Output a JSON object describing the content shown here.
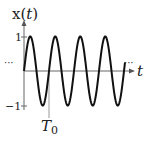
{
  "chart_data": {
    "type": "line",
    "title": "",
    "ylabel": "x(t)",
    "xlabel": "t",
    "y_ticks": [
      "1",
      "−1"
    ],
    "x_annotations": [
      "T0"
    ],
    "ellipsis_left": "···",
    "ellipsis_right": "···",
    "function": "sin(2πt/T0)",
    "periods_shown": 4.2,
    "ylim": [
      -1,
      1
    ]
  },
  "labels": {
    "ylabel_main": "x(",
    "ylabel_t": "t",
    "ylabel_close": ")",
    "xlabel": "t",
    "tick_pos": "1",
    "tick_neg": "−1",
    "t0_main": "T",
    "t0_sub": "0",
    "dots_left": "···",
    "dots_right": "···"
  },
  "colors": {
    "line": "#111111",
    "axis": "#555555",
    "text": "#222222"
  }
}
